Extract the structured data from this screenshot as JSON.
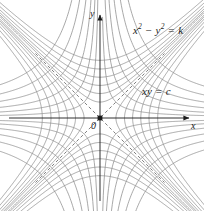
{
  "figure": {
    "title": "",
    "axes": {
      "x_label": "x",
      "y_label": "y",
      "origin_label": "0"
    },
    "annotations": {
      "family_k": {
        "base": "x",
        "sup1": "2",
        "mid": " − y",
        "sup2": "2",
        "tail": " = k",
        "full": "x² − y² = k"
      },
      "family_c": {
        "full": "xy = c"
      }
    },
    "colors": {
      "curve": "#8c8c8c",
      "axis": "#1a1a1a",
      "asymptote": "#6e6e6e",
      "background": "#ffffff",
      "text": "#1a1a1a"
    }
  },
  "chart_data": {
    "type": "line",
    "title": "",
    "subtitle": "",
    "xlabel": "x",
    "ylabel": "y",
    "xlim": [
      -4.2,
      4.2
    ],
    "ylim": [
      -4.2,
      4.2
    ],
    "grid": false,
    "legend": null,
    "annotations": [
      {
        "text": "x² − y² = k",
        "x": 2.2,
        "y": 3.1
      },
      {
        "text": "xy = c",
        "x": 2.4,
        "y": 0.95
      },
      {
        "text": "0",
        "x": -0.22,
        "y": -0.28
      }
    ],
    "asymptotes": [
      {
        "name": "y = x",
        "style": "dashed",
        "slope": 1,
        "intercept": 0
      },
      {
        "name": "y = -x",
        "style": "dashed",
        "slope": -1,
        "intercept": 0
      }
    ],
    "series": [
      {
        "name": "x^2 - y^2 = k",
        "family": "hyperbola-k",
        "style": "solid",
        "values": [
          -7.2,
          -5.2,
          -3.6,
          -2.3,
          -1.3,
          -0.55,
          0.55,
          1.3,
          2.3,
          3.6,
          5.2,
          7.2
        ]
      },
      {
        "name": "xy = c",
        "family": "hyperbola-c",
        "style": "solid",
        "values": [
          -7.2,
          -5.2,
          -3.6,
          -2.3,
          -1.3,
          -0.55,
          0.55,
          1.3,
          2.3,
          3.6,
          5.2,
          7.2
        ]
      }
    ]
  }
}
